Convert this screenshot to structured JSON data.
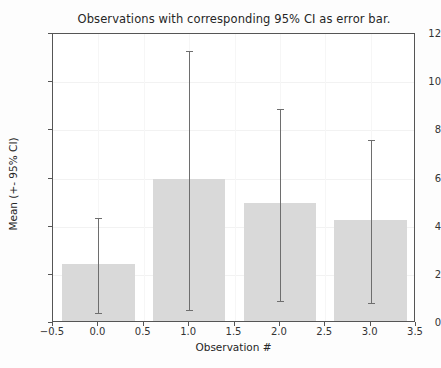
{
  "chart_data": {
    "type": "bar",
    "title": "Observations with corresponding 95% CI as error bar.",
    "xlabel": "Observation #",
    "ylabel": "Mean (+- 95% CI)",
    "categories": [
      "0.0",
      "1.0",
      "2.0",
      "3.0"
    ],
    "x": [
      0,
      1,
      2,
      3
    ],
    "values": [
      2.37,
      5.9,
      4.88,
      4.2
    ],
    "error_low": [
      0.4,
      0.52,
      0.9,
      0.85
    ],
    "error_high": [
      4.38,
      11.3,
      8.88,
      7.6
    ],
    "bar_width": 0.8,
    "xlim": [
      -0.5,
      3.5
    ],
    "ylim": [
      0,
      12
    ],
    "xticks": [
      "-0.5",
      "0.0",
      "0.5",
      "1.0",
      "1.5",
      "2.0",
      "2.5",
      "3.0",
      "3.5"
    ],
    "xtick_values": [
      -0.5,
      0.0,
      0.5,
      1.0,
      1.5,
      2.0,
      2.5,
      3.0,
      3.5
    ],
    "yticks": [
      "0",
      "2",
      "4",
      "6",
      "8",
      "10",
      "12"
    ],
    "ytick_values": [
      0,
      2,
      4,
      6,
      8,
      10,
      12
    ],
    "grid": true,
    "legend": null,
    "bar_color": "#d9d9d9",
    "error_color": "#6e6e6e",
    "axes_color": "#555555",
    "background_color": "#ffffff"
  }
}
